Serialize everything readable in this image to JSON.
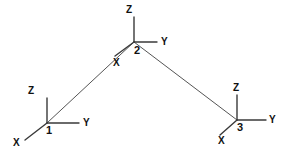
{
  "diagram": {
    "type": "structural-frame-node-coordinate-systems",
    "background_color": "#ffffff",
    "beam_color": "#555555",
    "axis_color": "#3a3a3a",
    "label_color": "#111111",
    "nodes": [
      {
        "id": "node-1",
        "number": "1",
        "number_label_x": 46,
        "number_label_y": 134,
        "origin_x": 47,
        "origin_y": 123,
        "axes": {
          "z": {
            "label": "Z",
            "end_x": 47,
            "end_y": 98,
            "label_x": 28,
            "label_y": 94
          },
          "y": {
            "label": "Y",
            "end_x": 79,
            "end_y": 123,
            "label_x": 83,
            "label_y": 126
          },
          "x": {
            "label": "X",
            "end_x": 25,
            "end_y": 140,
            "label_x": 13,
            "label_y": 146
          }
        }
      },
      {
        "id": "node-2",
        "number": "2",
        "number_label_x": 134,
        "number_label_y": 54,
        "origin_x": 134,
        "origin_y": 42,
        "axes": {
          "z": {
            "label": "Z",
            "end_x": 134,
            "end_y": 17,
            "label_x": 126,
            "label_y": 13
          },
          "y": {
            "label": "Y",
            "end_x": 157,
            "end_y": 42,
            "label_x": 161,
            "label_y": 45
          },
          "x": {
            "label": "X",
            "end_x": 115,
            "end_y": 56,
            "label_x": 113,
            "label_y": 66
          }
        }
      },
      {
        "id": "node-3",
        "number": "3",
        "number_label_x": 237,
        "number_label_y": 131,
        "origin_x": 237,
        "origin_y": 120,
        "axes": {
          "z": {
            "label": "Z",
            "end_x": 237,
            "end_y": 95,
            "label_x": 233,
            "label_y": 91
          },
          "y": {
            "label": "Y",
            "end_x": 266,
            "end_y": 120,
            "label_x": 269,
            "label_y": 123
          },
          "x": {
            "label": "X",
            "end_x": 220,
            "end_y": 135,
            "label_x": 218,
            "label_y": 144
          }
        }
      }
    ],
    "members": [
      {
        "id": "member-1-2",
        "from": "node-1",
        "from_x": 47,
        "from_y": 123,
        "to": "node-2",
        "to_x": 134,
        "to_y": 42
      },
      {
        "id": "member-2-3",
        "from": "node-2",
        "from_x": 134,
        "from_y": 42,
        "to": "node-3",
        "to_x": 237,
        "to_y": 120
      }
    ]
  }
}
